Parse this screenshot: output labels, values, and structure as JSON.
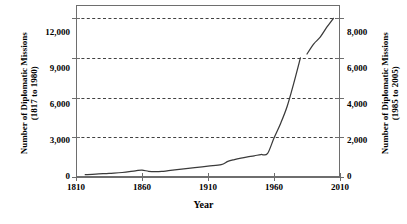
{
  "chart_data": {
    "type": "line",
    "title": "",
    "xlabel": "Year",
    "ylabel": "Number of Diplomatic Missions (1817 to 1980)",
    "y2label": "Number of Diplomatic Missions (1985 to 2005)",
    "xlim": [
      1810,
      2010
    ],
    "ylim": [
      0,
      13000
    ],
    "y2lim": [
      0,
      8670
    ],
    "grid": true,
    "grid_style": "dashed horizontal",
    "legend": "none",
    "xticks": [
      1810,
      1860,
      1910,
      1960,
      2010
    ],
    "xticklabels": [
      "1810",
      "1860",
      "1910",
      "1960",
      "2010"
    ],
    "yticks": [
      0,
      3000,
      6000,
      9000,
      12000
    ],
    "yticklabels": [
      "0",
      "3,000",
      "6,000",
      "9,000",
      "12,000"
    ],
    "y2ticks": [
      0,
      2000,
      4000,
      6000,
      8000
    ],
    "y2ticklabels": [
      "0",
      "2,000",
      "4,000",
      "6,000",
      "8,000"
    ],
    "line_color": "#3a3a3a",
    "axis_color": "#6e6e6e",
    "series": [
      {
        "name": "Diplomatic missions 1817 to 1980",
        "axis": "left",
        "x": [
          1817,
          1825,
          1835,
          1845,
          1855,
          1860,
          1865,
          1870,
          1875,
          1880,
          1890,
          1900,
          1910,
          1920,
          1925,
          1930,
          1935,
          1940,
          1945,
          1950,
          1955,
          1960,
          1965,
          1970,
          1975,
          1980
        ],
        "values": [
          180,
          210,
          280,
          340,
          470,
          520,
          430,
          400,
          420,
          480,
          600,
          700,
          820,
          930,
          1180,
          1320,
          1430,
          1520,
          1600,
          1700,
          1760,
          2950,
          4050,
          5350,
          7100,
          9000
        ]
      },
      {
        "name": "Diplomatic missions 1985 to 2005",
        "axis": "right",
        "x": [
          1985,
          1990,
          1995,
          2000,
          2005
        ],
        "values": [
          6200,
          6700,
          7050,
          7550,
          8000
        ]
      }
    ],
    "annotations": [
      "Line breaks between 1980 and 1985 where the vertical scale switches from the left axis to the right axis."
    ]
  },
  "axes": {
    "left_title_line1": "Number of Diplomatic Missions",
    "left_title_line2": "(1817 to 1980)",
    "right_title_line1": "Number of Diplomatic Missions",
    "right_title_line2": "(1985 to 2005)",
    "x_title": "Year"
  }
}
